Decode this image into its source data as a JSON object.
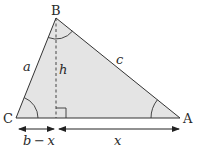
{
  "diagram": {
    "title": "",
    "vertices": {
      "A": {
        "label": "A",
        "x": 180,
        "y": 118
      },
      "B": {
        "label": "B",
        "x": 56,
        "y": 18
      },
      "C": {
        "label": "C",
        "x": 16,
        "y": 118
      }
    },
    "sides": {
      "a": {
        "label": "a"
      },
      "c": {
        "label": "c"
      }
    },
    "altitude": {
      "label": "h",
      "foot_x": 56
    },
    "dimensions": {
      "left": {
        "label": "b − x"
      },
      "right": {
        "label": "x"
      }
    },
    "colors": {
      "fill": "#e4e4e4",
      "stroke": "#333333"
    }
  }
}
